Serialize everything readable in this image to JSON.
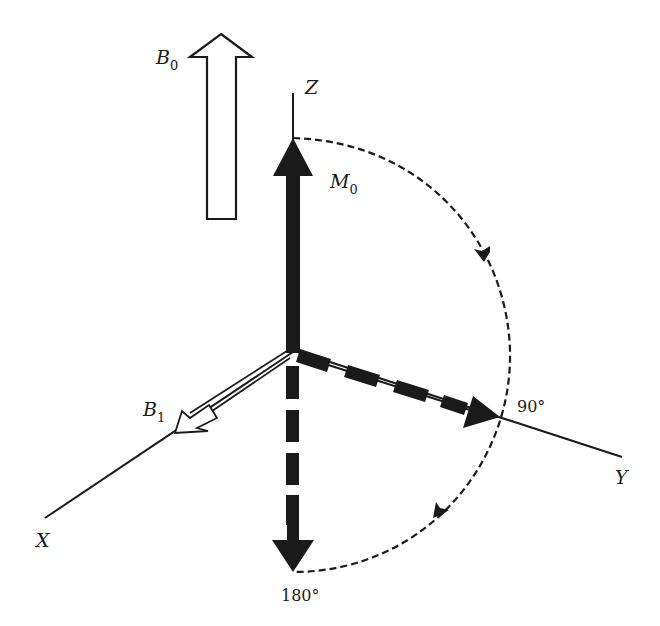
{
  "figure": {
    "colors": {
      "ink": "#1a1a1a",
      "background": "#ffffff"
    }
  },
  "axes": {
    "z_label": "Z",
    "y_label": "Y",
    "x_label": "X"
  },
  "vectors": {
    "b0": {
      "label": "B",
      "subscript": "0",
      "style": "hollow-arrow"
    },
    "b1": {
      "label": "B",
      "subscript": "1",
      "style": "double-line-arrow"
    },
    "m0": {
      "label": "M",
      "subscript": "0",
      "style": "solid-arrow"
    }
  },
  "angles": {
    "ninety": "90°",
    "one_eighty": "180°"
  },
  "rotation_path": {
    "style": "dashed-arc",
    "direction": "clockwise"
  }
}
